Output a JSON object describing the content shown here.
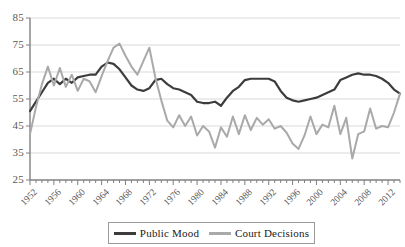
{
  "chart_data": {
    "type": "line",
    "title": "",
    "subtitle": "",
    "xlabel": "",
    "ylabel": "",
    "xlim": [
      1952,
      2014
    ],
    "ylim": [
      25,
      85
    ],
    "grid": true,
    "legend_position": "bottom",
    "y_ticks": [
      25,
      35,
      45,
      55,
      65,
      75,
      85
    ],
    "x_ticks": [
      1952,
      1956,
      1960,
      1964,
      1968,
      1972,
      1976,
      1980,
      1984,
      1988,
      1992,
      1996,
      2000,
      2004,
      2008,
      2012
    ],
    "x_minor_tick_interval": 1,
    "x": [
      1952,
      1953,
      1954,
      1955,
      1956,
      1957,
      1958,
      1959,
      1960,
      1961,
      1962,
      1963,
      1964,
      1965,
      1966,
      1967,
      1968,
      1969,
      1970,
      1971,
      1972,
      1973,
      1974,
      1975,
      1976,
      1977,
      1978,
      1979,
      1980,
      1981,
      1982,
      1983,
      1984,
      1985,
      1986,
      1987,
      1988,
      1989,
      1990,
      1991,
      1992,
      1993,
      1994,
      1995,
      1996,
      1997,
      1998,
      1999,
      2000,
      2001,
      2002,
      2003,
      2004,
      2005,
      2006,
      2007,
      2008,
      2009,
      2010,
      2011,
      2012,
      2013,
      2014
    ],
    "series": [
      {
        "name": "Public Mood",
        "color": "#3c3c3c",
        "width": 2.2,
        "values": [
          50.5,
          54.0,
          57.5,
          61.0,
          62.5,
          60.5,
          62.5,
          61.0,
          63.0,
          63.5,
          64.0,
          64.0,
          67.0,
          68.5,
          68.0,
          66.0,
          63.0,
          60.0,
          58.5,
          58.0,
          59.0,
          62.0,
          62.5,
          60.5,
          59.0,
          58.5,
          57.5,
          56.5,
          54.0,
          53.5,
          53.5,
          54.0,
          52.5,
          55.5,
          58.0,
          59.5,
          62.0,
          62.5,
          62.5,
          62.5,
          62.5,
          61.5,
          58.0,
          55.5,
          54.5,
          54.0,
          54.5,
          55.0,
          55.5,
          56.5,
          57.5,
          58.5,
          62.0,
          63.0,
          64.0,
          64.5,
          64.0,
          64.0,
          63.5,
          62.5,
          61.0,
          58.5,
          57.0
        ]
      },
      {
        "name": "Court Decisions",
        "color": "#a9a9a9",
        "width": 2.0,
        "values": [
          42.0,
          52.0,
          60.5,
          67.0,
          60.0,
          66.5,
          59.5,
          64.0,
          58.0,
          62.5,
          61.5,
          57.5,
          63.5,
          69.0,
          74.0,
          75.5,
          71.0,
          67.0,
          64.0,
          69.0,
          74.0,
          63.0,
          54.5,
          47.0,
          44.5,
          49.0,
          45.0,
          48.5,
          41.5,
          45.0,
          43.0,
          37.0,
          44.5,
          41.0,
          48.5,
          42.0,
          49.0,
          43.5,
          48.0,
          45.5,
          47.5,
          44.0,
          45.0,
          42.5,
          38.5,
          36.5,
          41.5,
          48.5,
          42.0,
          45.5,
          44.5,
          52.5,
          42.0,
          48.0,
          33.0,
          42.0,
          43.0,
          51.5,
          44.0,
          45.0,
          44.5,
          50.0,
          57.0
        ]
      }
    ]
  },
  "legend": {
    "entries": [
      {
        "label": "Public Mood",
        "color": "#3c3c3c"
      },
      {
        "label": "Court Decisions",
        "color": "#a9a9a9"
      }
    ]
  },
  "axes": {
    "y_tick_labels": [
      "85",
      "75",
      "65",
      "55",
      "45",
      "35",
      "25"
    ],
    "x_tick_labels": [
      "1952",
      "1956",
      "1960",
      "1964",
      "1968",
      "1972",
      "1976",
      "1980",
      "1984",
      "1988",
      "1992",
      "1996",
      "2000",
      "2004",
      "2008",
      "2012"
    ]
  },
  "style": {
    "background": "#ffffff",
    "grid_color": "#d9d9d9",
    "axis_color": "#808080",
    "tick_text_color": "#595959"
  }
}
